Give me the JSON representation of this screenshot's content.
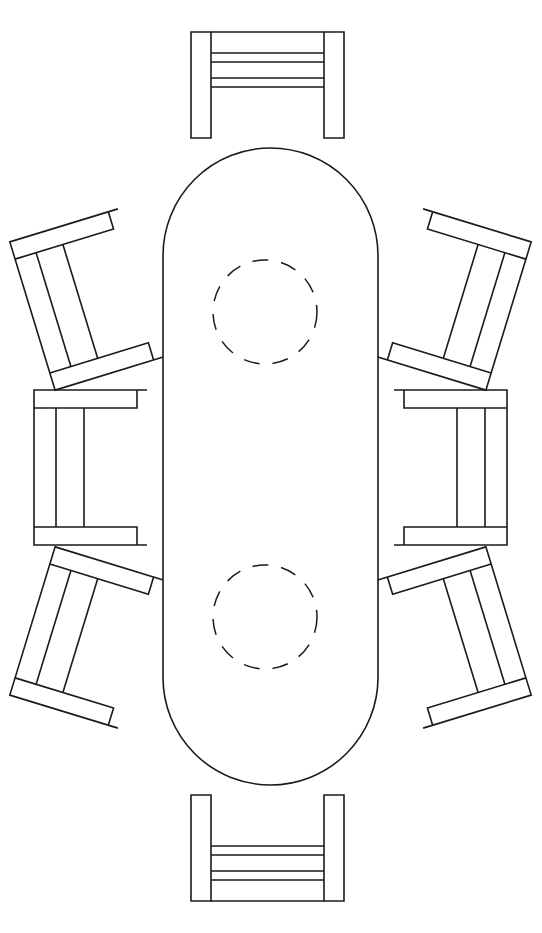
{
  "document": {
    "title": "Oval Dining Table Plan View",
    "description": "Top-down line drawing of an oval dining table surrounded by eight chairs",
    "background_color": "#ffffff",
    "line_color": "#1a1a1a",
    "line_width": 1.6
  },
  "canvas": {
    "width": 542,
    "height": 933
  },
  "table": {
    "name": "oval-dining-table",
    "shape": "stadium",
    "left": 163,
    "right": 378,
    "top": 148,
    "bottom": 785,
    "width": 215,
    "height": 637,
    "corner_radius": 107.5,
    "center_x": 270.5,
    "center_y": 466.5
  },
  "placemats": [
    {
      "name": "placemat-upper",
      "style": "dashed-circle",
      "cx": 265,
      "cy": 312,
      "r": 52
    },
    {
      "name": "placemat-lower",
      "style": "dashed-circle",
      "cx": 265,
      "cy": 617,
      "r": 52
    }
  ],
  "chairs": [
    {
      "name": "chair-top",
      "position": "top",
      "orientation": "facing-down",
      "rotation_deg": 0,
      "x": 191,
      "y": 32,
      "width": 153,
      "height": 106,
      "arm_width": 20,
      "rails": 2
    },
    {
      "name": "chair-bottom",
      "position": "bottom",
      "orientation": "facing-up",
      "rotation_deg": 180,
      "x": 191,
      "y": 795,
      "width": 153,
      "height": 106,
      "arm_width": 20,
      "rails": 2
    },
    {
      "name": "chair-left-middle",
      "position": "left-middle",
      "orientation": "facing-right",
      "rotation_deg": 0,
      "x": 34,
      "y": 390,
      "width": 113,
      "height": 155,
      "arm_width": 18,
      "rails": 2
    },
    {
      "name": "chair-right-middle",
      "position": "right-middle",
      "orientation": "facing-left",
      "rotation_deg": 0,
      "x": 394,
      "y": 390,
      "width": 113,
      "height": 155,
      "arm_width": 18,
      "rails": 2
    },
    {
      "name": "chair-upper-left",
      "position": "upper-left",
      "orientation": "facing-lower-right",
      "rotation_deg": -17,
      "x": 30,
      "y": 222,
      "width": 113,
      "height": 155,
      "arm_width": 18,
      "rails": 2
    },
    {
      "name": "chair-upper-right",
      "position": "upper-right",
      "orientation": "facing-lower-left",
      "rotation_deg": 17,
      "x": 398,
      "y": 222,
      "width": 113,
      "height": 155,
      "arm_width": 18,
      "rails": 2
    },
    {
      "name": "chair-lower-left",
      "position": "lower-left",
      "orientation": "facing-upper-right",
      "rotation_deg": 17,
      "x": 30,
      "y": 560,
      "width": 113,
      "height": 155,
      "arm_width": 18,
      "rails": 2
    },
    {
      "name": "chair-lower-right",
      "position": "lower-right",
      "orientation": "facing-upper-left",
      "rotation_deg": -17,
      "x": 398,
      "y": 560,
      "width": 113,
      "height": 155,
      "arm_width": 18,
      "rails": 2
    }
  ],
  "counts": {
    "chairs": 8,
    "tables": 1,
    "placemats": 2
  }
}
